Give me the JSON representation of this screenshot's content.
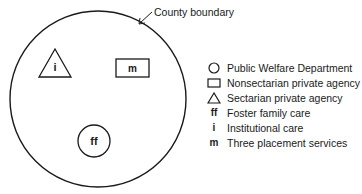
{
  "diagram": {
    "boundary_label": "County boundary",
    "inner_symbols": [
      {
        "shape": "triangle",
        "letter": "i"
      },
      {
        "shape": "rectangle",
        "letter": "m"
      },
      {
        "shape": "circle",
        "letter": "ff"
      }
    ]
  },
  "legend": {
    "items": [
      {
        "symbol": "circle-icon",
        "label": "Public Welfare Department"
      },
      {
        "symbol": "rectangle-icon",
        "label": "Nonsectarian private agency"
      },
      {
        "symbol": "triangle-icon",
        "label": "Sectarian private agency"
      },
      {
        "symbol": "ff",
        "label": "Foster family care"
      },
      {
        "symbol": "i",
        "label": "Institutional care"
      },
      {
        "symbol": "m",
        "label": "Three placement services"
      }
    ]
  }
}
